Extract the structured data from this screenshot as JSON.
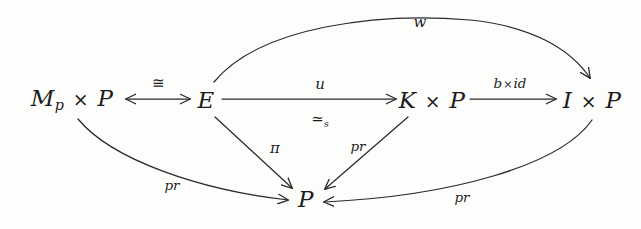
{
  "diagram": {
    "background_color": "#fdfdfc",
    "stroke_color": "#2a2a2a",
    "nodes": [
      {
        "id": "mp_times_p",
        "label_html": "M<sub>p</sub> <span class=\"times\">×</span> P",
        "plain": "M_p × P",
        "x": 72,
        "y": 100
      },
      {
        "id": "e",
        "label_html": "E",
        "plain": "E",
        "x": 206,
        "y": 100
      },
      {
        "id": "k_times_p",
        "label_html": "K <span class=\"times\">×</span> P",
        "plain": "K × P",
        "x": 432,
        "y": 100
      },
      {
        "id": "i_times_p",
        "label_html": "I <span class=\"times\">×</span> P",
        "plain": "I × P",
        "x": 592,
        "y": 100
      },
      {
        "id": "p_bottom",
        "label_html": "P",
        "plain": "P",
        "x": 306,
        "y": 199
      }
    ],
    "edges": [
      {
        "id": "iso-edge",
        "from": "mp_times_p",
        "to": "e",
        "label_html": "≅",
        "plain": "≅",
        "kind": "double-headed-horizontal",
        "label_x": 158,
        "label_y": 83
      },
      {
        "id": "u-edge",
        "from": "e",
        "to": "k_times_p",
        "label_html": "u",
        "plain": "u",
        "kind": "horizontal-arrow",
        "label_x": 320,
        "label_y": 84
      },
      {
        "id": "u-edge-sub",
        "from": "e",
        "to": "k_times_p",
        "label_html": "≃<sub>s</sub>",
        "plain": "≃_s",
        "kind": "label-below",
        "label_x": 320,
        "label_y": 120
      },
      {
        "id": "bxid-edge",
        "from": "k_times_p",
        "to": "i_times_p",
        "label_html": "b<span class=\"times\">×</span>id",
        "plain": "b×id",
        "kind": "horizontal-arrow",
        "label_x": 510,
        "label_y": 84
      },
      {
        "id": "w-edge",
        "from": "e",
        "to": "i_times_p",
        "label_html": "w",
        "plain": "w",
        "kind": "curve-over",
        "label_x": 420,
        "label_y": 22
      },
      {
        "id": "pr-left-edge",
        "from": "mp_times_p",
        "to": "p_bottom",
        "label_html": "pr",
        "plain": "pr",
        "kind": "curve-under",
        "label_x": 172,
        "label_y": 186
      },
      {
        "id": "pi-edge",
        "from": "e",
        "to": "p_bottom",
        "label_html": "π",
        "plain": "π",
        "kind": "straight-diagonal",
        "label_x": 275,
        "label_y": 148
      },
      {
        "id": "pr-mid-edge",
        "from": "k_times_p",
        "to": "p_bottom",
        "label_html": "pr",
        "plain": "pr",
        "kind": "straight-diagonal",
        "label_x": 358,
        "label_y": 147
      },
      {
        "id": "pr-right-edge",
        "from": "i_times_p",
        "to": "p_bottom",
        "label_html": "pr",
        "plain": "pr",
        "kind": "curve-under",
        "label_x": 462,
        "label_y": 198
      }
    ]
  }
}
